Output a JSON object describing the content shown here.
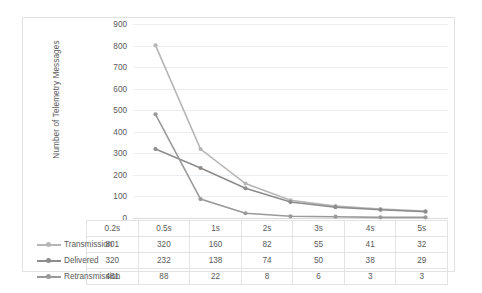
{
  "chart_data": {
    "type": "line",
    "title": "",
    "xlabel": "",
    "ylabel": "Number of Telemetry Messages",
    "categories": [
      "0.2s",
      "0.5s",
      "1s",
      "2s",
      "3s",
      "4s",
      "5s"
    ],
    "ylim": [
      0,
      900
    ],
    "ytick_labels": [
      "900",
      "800",
      "700",
      "600",
      "500",
      "400",
      "300",
      "200",
      "100",
      "0"
    ],
    "ytick_values": [
      900,
      800,
      700,
      600,
      500,
      400,
      300,
      200,
      100,
      0
    ],
    "grid": true,
    "legend_position": "data-table-below",
    "series": [
      {
        "name": "Transmission",
        "color": "#b6b6b6",
        "values": [
          801,
          320,
          160,
          82,
          55,
          41,
          32
        ]
      },
      {
        "name": "Delivered",
        "color": "#8c8c8c",
        "values": [
          320,
          232,
          138,
          74,
          50,
          38,
          29
        ]
      },
      {
        "name": "Retransmission",
        "color": "#9a9a9a",
        "values": [
          481,
          88,
          22,
          8,
          6,
          3,
          3
        ]
      }
    ]
  },
  "table": {
    "header": [
      "0.2s",
      "0.5s",
      "1s",
      "2s",
      "3s",
      "4s",
      "5s"
    ],
    "rows": [
      {
        "label": "Transmission",
        "values": [
          "801",
          "320",
          "160",
          "82",
          "55",
          "41",
          "32"
        ]
      },
      {
        "label": "Delivered",
        "values": [
          "320",
          "232",
          "138",
          "74",
          "50",
          "38",
          "29"
        ]
      },
      {
        "label": "Retransmission",
        "values": [
          "481",
          "88",
          "22",
          "8",
          "6",
          "3",
          "3"
        ]
      }
    ]
  },
  "colors": {
    "transmission": "#b6b6b6",
    "delivered": "#8c8c8c",
    "retransmission": "#9a9a9a",
    "grid": "#eceff1",
    "text": "#5a5a5a",
    "frame": "#e2e2e2"
  }
}
